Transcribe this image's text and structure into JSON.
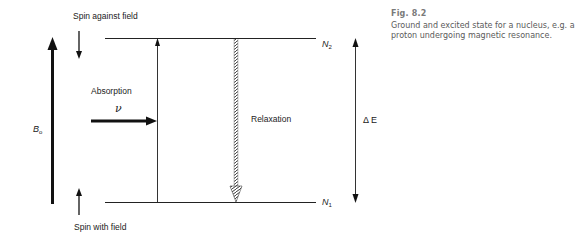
{
  "figure": {
    "number_label": "Fig. 8.2",
    "caption": "Ground and excited state for a nucleus, e.g. a proton undergoing magnetic resonance."
  },
  "diagram": {
    "title_top": "Spin against field",
    "title_bottom": "Spin with field",
    "field_label": {
      "main": "B",
      "sub": "o"
    },
    "absorption_label": "Absorption",
    "frequency_symbol": "ν",
    "relaxation_label": "Relaxation",
    "upper_level": {
      "main": "N",
      "sub": "2"
    },
    "lower_level": {
      "main": "N",
      "sub": "1"
    },
    "energy_gap_label": "Δ E",
    "colors": {
      "line": "#1a1a1a",
      "caption": "#5a5a5a"
    }
  }
}
